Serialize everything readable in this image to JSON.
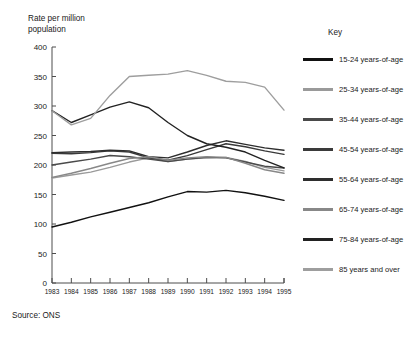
{
  "axis_title": "Rate per million\npopulation",
  "source": "Source: ONS",
  "key_title": "Key",
  "legend": [
    {
      "label": "15-24 years-of-age",
      "color": "#111111"
    },
    {
      "label": "25-34 years-of-age",
      "color": "#9a9a9a"
    },
    {
      "label": "35-44 years-of-age",
      "color": "#4a4a4a"
    },
    {
      "label": "45-54 years-of-age",
      "color": "#3a3a3a"
    },
    {
      "label": "55-64 years-of-age",
      "color": "#2e2e2e"
    },
    {
      "label": "65-74 years-of-age",
      "color": "#888888"
    },
    {
      "label": "75-84 years-of-age",
      "color": "#222222"
    },
    {
      "label": "85 years and over",
      "color": "#9e9e9e"
    }
  ],
  "chart_data": {
    "type": "line",
    "title": "",
    "xlabel": "",
    "ylabel": "Rate per million population",
    "xlim": [
      1983,
      1995
    ],
    "ylim": [
      0,
      400
    ],
    "ytick_step": 50,
    "grid": false,
    "legend_position": "right",
    "x": [
      1983,
      1984,
      1985,
      1986,
      1987,
      1988,
      1989,
      1990,
      1991,
      1992,
      1993,
      1994,
      1995
    ],
    "ytick_labels": [
      "0",
      "50",
      "100",
      "150",
      "200",
      "250",
      "300",
      "350",
      "400"
    ],
    "xtick_labels": [
      "1983",
      "1984",
      "1985",
      "1986",
      "1987",
      "1988",
      "1989",
      "1990",
      "1991",
      "1992",
      "1993",
      "1994",
      "1995"
    ],
    "series": [
      {
        "name": "15-24 years-of-age",
        "color": "#111111",
        "values": [
          95,
          103,
          112,
          120,
          128,
          136,
          146,
          155,
          154,
          157,
          153,
          147,
          140
        ]
      },
      {
        "name": "25-34 years-of-age",
        "color": "#9a9a9a",
        "values": [
          178,
          183,
          188,
          196,
          205,
          212,
          206,
          210,
          212,
          213,
          206,
          196,
          190
        ]
      },
      {
        "name": "35-44 years-of-age",
        "color": "#4a4a4a",
        "values": [
          200,
          205,
          210,
          216,
          214,
          210,
          206,
          210,
          213,
          212,
          205,
          198,
          195
        ]
      },
      {
        "name": "45-54 years-of-age",
        "color": "#3a3a3a",
        "values": [
          220,
          219,
          221,
          224,
          222,
          212,
          208,
          216,
          226,
          236,
          231,
          224,
          218
        ]
      },
      {
        "name": "55-64 years-of-age",
        "color": "#2e2e2e",
        "values": [
          221,
          222,
          223,
          225,
          224,
          214,
          212,
          222,
          233,
          241,
          235,
          229,
          225
        ]
      },
      {
        "name": "65-74 years-of-age",
        "color": "#888888",
        "values": [
          179,
          186,
          194,
          203,
          211,
          214,
          208,
          212,
          214,
          213,
          203,
          192,
          186
        ]
      },
      {
        "name": "75-84 years-of-age",
        "color": "#222222",
        "values": [
          292,
          272,
          285,
          298,
          307,
          297,
          272,
          250,
          236,
          230,
          222,
          208,
          195
        ]
      },
      {
        "name": "85 years and over",
        "color": "#9e9e9e",
        "values": [
          292,
          268,
          279,
          318,
          350,
          352,
          354,
          360,
          352,
          342,
          340,
          332,
          293
        ]
      }
    ]
  }
}
